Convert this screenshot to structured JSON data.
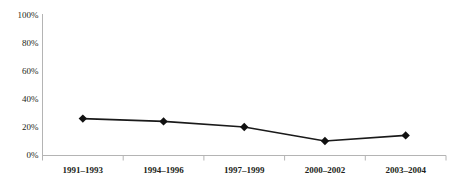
{
  "chart_data": {
    "type": "line",
    "title": "",
    "subtitle": "",
    "xlabel": "",
    "ylabel": "",
    "categories": [
      "1991–1993",
      "1994–1996",
      "1997–1999",
      "2000–2002",
      "2003–2004"
    ],
    "values": [
      26,
      24,
      20,
      10,
      14
    ],
    "series": [
      {
        "name": "",
        "values": [
          26,
          24,
          20,
          10,
          14
        ]
      }
    ],
    "ylim": [
      0,
      100
    ],
    "yticks": [
      0,
      20,
      40,
      60,
      80,
      100
    ],
    "ytick_labels": [
      "0%",
      "20%",
      "40%",
      "60%",
      "80%",
      "100%"
    ],
    "grid": false,
    "legend": "none",
    "marker": "diamond",
    "value_format": "percent",
    "colors": {
      "line": "#1a1a1a",
      "marker": "#111111",
      "axis": "#b4b4b4",
      "text": "#231f20",
      "background": "#ffffff"
    }
  }
}
